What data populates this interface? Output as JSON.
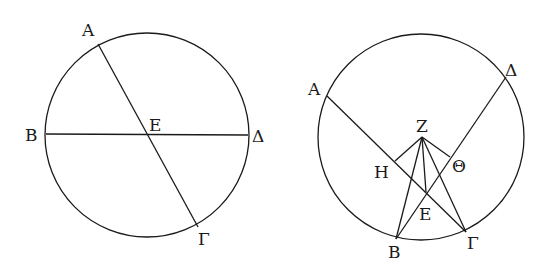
{
  "figures": [
    {
      "id": "left",
      "circle": {
        "cx": 147,
        "cy": 135,
        "r": 102
      },
      "points": {
        "A": {
          "x": 98,
          "y": 44
        },
        "B": {
          "x": 46,
          "y": 134
        },
        "Gamma": {
          "x": 198,
          "y": 227
        },
        "Delta": {
          "x": 248,
          "y": 135
        },
        "E": {
          "x": 147,
          "y": 134
        }
      },
      "labels": {
        "A": "A",
        "B": "B",
        "Gamma": "Γ",
        "Delta": "Δ",
        "E": "E"
      }
    },
    {
      "id": "right",
      "circle": {
        "cx": 421,
        "cy": 137,
        "r": 103
      },
      "points": {
        "A": {
          "x": 327,
          "y": 96
        },
        "Delta": {
          "x": 506,
          "y": 77
        },
        "Z": {
          "x": 422,
          "y": 137
        },
        "H": {
          "x": 395,
          "y": 161
        },
        "Theta": {
          "x": 450,
          "y": 157
        },
        "E": {
          "x": 426,
          "y": 192
        },
        "B": {
          "x": 396,
          "y": 239
        },
        "Gamma": {
          "x": 466,
          "y": 232
        }
      },
      "labels": {
        "A": "A",
        "Delta": "Δ",
        "Z": "Z",
        "H": "H",
        "Theta": "Θ",
        "E": "E",
        "B": "B",
        "Gamma": "Γ"
      }
    }
  ]
}
